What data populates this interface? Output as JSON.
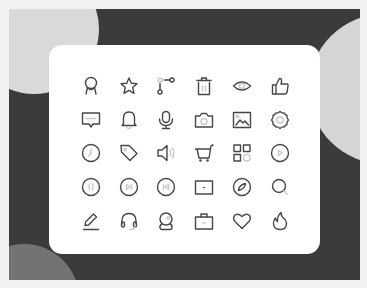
{
  "canvas": {
    "background": "#f2f2f2",
    "frame_color": "#3b3b3b",
    "card_color": "#ffffff",
    "icon_stroke": "#474747"
  },
  "decorations": [
    {
      "name": "top-left-circle",
      "color": "#d9d9d9"
    },
    {
      "name": "top-right-circle",
      "color": "#d5d5d5"
    },
    {
      "name": "bottom-left-circle",
      "color": "#737373"
    }
  ],
  "icon_grid": {
    "columns": 6,
    "rows": 5,
    "icons": [
      [
        "award-icon",
        "star-icon",
        "git-branch-icon",
        "trash-icon",
        "eye-icon",
        "thumbs-up-icon"
      ],
      [
        "message-icon",
        "bell-icon",
        "microphone-icon",
        "camera-icon",
        "image-icon",
        "settings-icon"
      ],
      [
        "clock-icon",
        "tag-icon",
        "volume-icon",
        "shopping-cart-icon",
        "apps-grid-icon",
        "play-circle-icon"
      ],
      [
        "pause-circle-icon",
        "next-circle-icon",
        "previous-circle-icon",
        "wallet-icon",
        "compass-icon",
        "search-icon"
      ],
      [
        "edit-icon",
        "headphones-icon",
        "webcam-icon",
        "briefcase-icon",
        "heart-icon",
        "fire-icon"
      ]
    ]
  }
}
